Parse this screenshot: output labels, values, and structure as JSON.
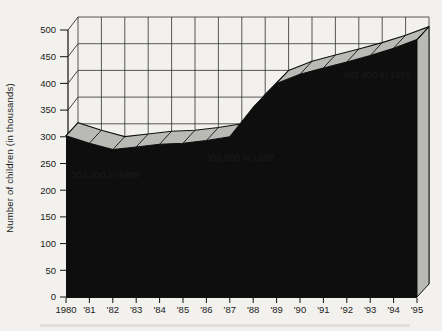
{
  "chart": {
    "colors": {
      "area": "#0e0e0e",
      "ribbon": "#b9b9b6",
      "paper": "#f2f1ed",
      "grid_line": "#2f2f2f",
      "outline": "#111111",
      "label_text": "#1b1b1b",
      "annotation_text": "#ededea"
    }
  },
  "chart_data": {
    "type": "area",
    "style": "3d-ribbon-area",
    "title": "",
    "xlabel": "",
    "ylabel": "Number of children (in thousands)",
    "x": [
      1980,
      1981,
      1982,
      1983,
      1984,
      1985,
      1986,
      1987,
      1988,
      1989,
      1990,
      1991,
      1992,
      1993,
      1994,
      1995
    ],
    "x_tick_labels": [
      "1980",
      "'81",
      "'82",
      "'83",
      "'84",
      "'85",
      "'86",
      "'87",
      "'88",
      "'89",
      "'90",
      "'91",
      "'92",
      "'93",
      "'94",
      "'95"
    ],
    "values": [
      302,
      288,
      276,
      281,
      286,
      288,
      293,
      300,
      355,
      400,
      417,
      429,
      440,
      452,
      466,
      482
    ],
    "unit": "thousands",
    "ylim": [
      0,
      500
    ],
    "y_tick_step": 50,
    "y_tick_labels": [
      "0",
      "50",
      "100",
      "150",
      "200",
      "250",
      "300",
      "350",
      "400",
      "450",
      "500"
    ],
    "grid": true,
    "legend": false,
    "annotations": [
      {
        "text": "302,000 in 1980",
        "year": 1980,
        "value": 302
      },
      {
        "text": "300,000 in 1987",
        "year": 1987,
        "value": 300
      },
      {
        "text": "482,000 in 1995",
        "year": 1995,
        "value": 482
      }
    ]
  }
}
